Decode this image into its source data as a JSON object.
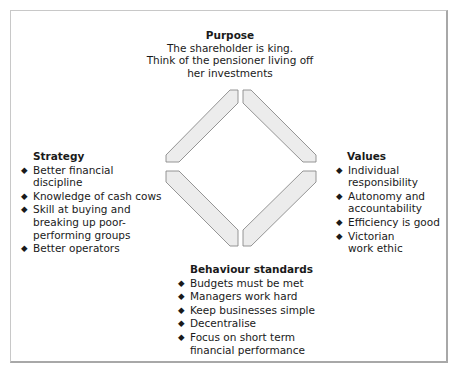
{
  "diagram": {
    "purpose": {
      "title": "Purpose",
      "lines": [
        "The shareholder is king.",
        "Think of the pensioner living off",
        "her investments"
      ]
    },
    "strategy": {
      "title": "Strategy",
      "items": [
        "Better financial discipline",
        "Knowledge of cash cows",
        "Skill at buying and breaking up poor-performing groups",
        "Better operators"
      ]
    },
    "values": {
      "title": "Values",
      "items": [
        "Individual responsibility",
        "Autonomy and accountability",
        "Efficiency is good",
        "Victorian work ethic"
      ]
    },
    "behaviour": {
      "title": "Behaviour standards",
      "items": [
        "Budgets must be met",
        "Managers work hard",
        "Keep businesses simple",
        "Decentralise",
        "Focus on short term financial performance"
      ]
    },
    "bullet_glyph": "◆",
    "colors": {
      "bar_fill": "#ececec",
      "bar_stroke": "#8a8a8a",
      "frame": "#b0b0b0"
    }
  }
}
